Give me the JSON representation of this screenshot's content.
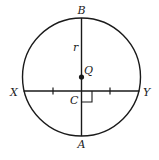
{
  "diagram": {
    "labels": {
      "B": "B",
      "A": "A",
      "X": "X",
      "Y": "Y",
      "Q": "Q",
      "C": "C",
      "r": "r"
    },
    "stroke_color": "#1a1a1a"
  }
}
